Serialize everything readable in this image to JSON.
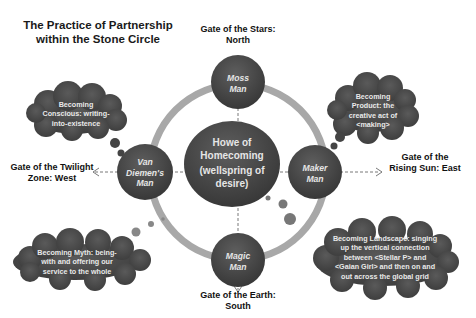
{
  "title": {
    "line1": "The Practice of Partnership",
    "line2": "within the Stone Circle"
  },
  "center": {
    "line1": "Howe of",
    "line2": "Homecoming",
    "line3": "(wellspring of",
    "line4": "desire)"
  },
  "nodes": {
    "north": {
      "line1": "Moss",
      "line2": "Man"
    },
    "east": {
      "line1": "Maker",
      "line2": "Man"
    },
    "south": {
      "line1": "Magic",
      "line2": "Man"
    },
    "west": {
      "line1": "Van",
      "line2": "Diemen's",
      "line3": "Man"
    }
  },
  "gates": {
    "north": {
      "line1": "Gate of the Stars:",
      "line2": "North"
    },
    "east": {
      "line1": "Gate of the",
      "line2": "Rising Sun: East"
    },
    "south": {
      "line1": "Gate of the Earth:",
      "line2": "South"
    },
    "west": {
      "line1": "Gate of the Twilight",
      "line2": "Zone: West"
    }
  },
  "clouds": {
    "top_left": {
      "line1": "Becoming",
      "line2": "Conscious: writing-",
      "line3": "into-existence"
    },
    "top_right": {
      "line1": "Becoming",
      "line2": "Product: the",
      "line3": "creative act of",
      "line4": "<making>"
    },
    "bottom_left": {
      "line1": "Becoming Myth: being-",
      "line2": "with and offering our",
      "line3": "service to the whole"
    },
    "bottom_right": {
      "line1": "Becoming Landscape: singing",
      "line2": "up the vertical connection",
      "line3": "between <Stellar P> and",
      "line4": "<Gaian Girl> and then on and",
      "line5": "out across the global grid"
    }
  },
  "colors": {
    "node_fill": "#4a4a4a",
    "ring": "#a9a9a9",
    "cloud_fill": "#4d4d4d",
    "text_light": "#e6e6e6",
    "text_dark": "#111111"
  }
}
